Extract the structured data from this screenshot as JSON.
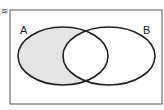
{
  "diagram": {
    "type": "venn",
    "corner_mark": "≋",
    "universe": {
      "x": 10,
      "y": 10,
      "width": 152,
      "height": 94
    },
    "sets": [
      {
        "label": "A",
        "cx": 63,
        "cy": 56,
        "rx": 45,
        "ry": 29,
        "label_x": 20,
        "label_y": 25
      },
      {
        "label": "B",
        "cx": 109,
        "cy": 56,
        "rx": 46,
        "ry": 29,
        "label_x": 143,
        "label_y": 25
      }
    ],
    "shaded_region": "A minus B",
    "colors": {
      "stroke": "#222222",
      "shade": "#e4e4e4",
      "frame": "#555555"
    }
  }
}
